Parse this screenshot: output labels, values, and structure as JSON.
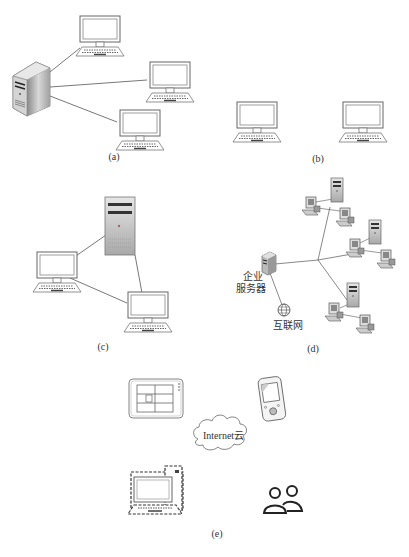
{
  "panels": {
    "a": {
      "caption": "(a)",
      "description": "server connected to three computers"
    },
    "b": {
      "caption": "(b)",
      "description": "two standalone computers"
    },
    "c": {
      "caption": "(c)",
      "description": "tower server connected to two computers"
    },
    "d": {
      "caption": "(d)",
      "enterprise_server_label_line1": "企业",
      "enterprise_server_label_line2": "服务器",
      "internet_label": "互联网",
      "description": "enterprise server connected to internet and three workgroups"
    },
    "e": {
      "caption": "(e)",
      "cloud_label": "Internet云",
      "description": "tablet, handheld device, dashed computer and users around internet cloud"
    }
  },
  "colors": {
    "line": "#555555",
    "device_stroke": "#666666",
    "server_fill": "#b8b8b8"
  }
}
